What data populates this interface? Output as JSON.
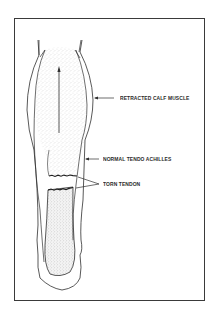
{
  "figure": {
    "frame_color": "#3a3a3a",
    "line_color": "#2f2f2f",
    "stipple_color": "#b8b8b8",
    "background": "#ffffff"
  },
  "labels": {
    "retracted_calf_muscle": "RETRACTED CALF MUSCLE",
    "normal_tendo_achilles": "NORMAL TENDO ACHILLES",
    "torn_tendon": "TORN TENDON"
  },
  "annotations": [
    {
      "id": "arrow-calf",
      "points_to": "retracted_calf_muscle",
      "direction": "left"
    },
    {
      "id": "arrow-normal",
      "points_to": "normal_tendo_achilles",
      "direction": "left"
    },
    {
      "id": "arrow-torn",
      "points_to": "torn_tendon",
      "direction": "left",
      "branches": 2
    },
    {
      "id": "arrow-retraction",
      "meaning": "upward retraction of calf muscle",
      "direction": "up"
    }
  ]
}
